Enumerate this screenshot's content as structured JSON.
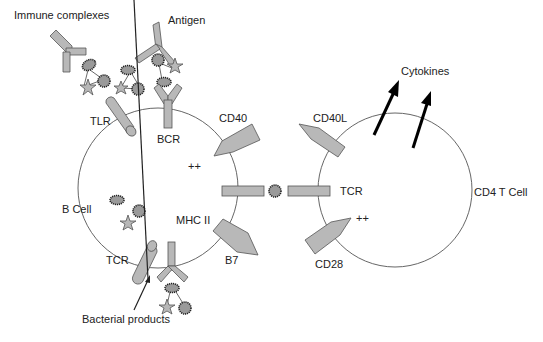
{
  "diagram": {
    "labels": {
      "immune_complexes": "Immune complexes",
      "antigen": "Antigen",
      "tlr": "TLR",
      "bcr": "BCR",
      "cd40": "CD40",
      "plus_b": "++",
      "b_cell": "B Cell",
      "mhc2": "MHC II",
      "tcr_b": "TCR",
      "b7": "B7",
      "bacterial": "Bacterial products",
      "cytokines": "Cytokines",
      "cd40l": "CD40L",
      "tcr_t": "TCR",
      "plus_t": "++",
      "cd28": "CD28",
      "cd4": "CD4 T Cell"
    },
    "colors": {
      "molecule_fill": "#b8b8b8",
      "outline": "#555555",
      "arrow": "#000000"
    }
  }
}
